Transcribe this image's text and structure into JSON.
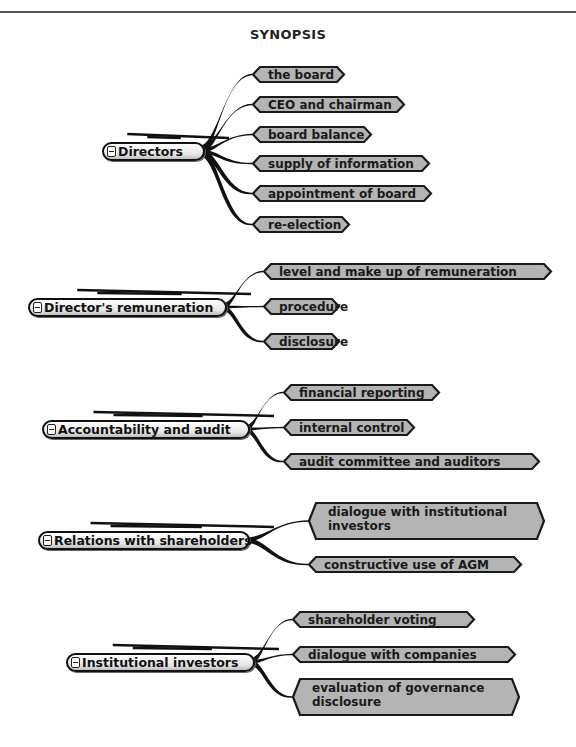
{
  "title": "SYNOPSIS",
  "colors": {
    "node_fill": "#b4b4b4",
    "node_border": "#1a1a1a",
    "connector": "#111111"
  },
  "groups": [
    {
      "label": "Directors",
      "root": {
        "x": 102,
        "y": 142,
        "w": 101
      },
      "children": [
        {
          "label": "the board",
          "x": 252,
          "y": 66,
          "w": 93,
          "h": 17
        },
        {
          "label": "CEO and chairman",
          "x": 252,
          "y": 96,
          "w": 153,
          "h": 17
        },
        {
          "label": "board balance",
          "x": 252,
          "y": 126,
          "w": 120,
          "h": 17
        },
        {
          "label": "supply of information",
          "x": 252,
          "y": 155,
          "w": 178,
          "h": 17
        },
        {
          "label": "appointment of board",
          "x": 252,
          "y": 185,
          "w": 180,
          "h": 17
        },
        {
          "label": "re-election",
          "x": 252,
          "y": 216,
          "w": 98,
          "h": 17
        }
      ]
    },
    {
      "label": "Director's remuneration",
      "root": {
        "x": 28,
        "y": 298,
        "w": 197
      },
      "children": [
        {
          "label": "level and make up of remuneration",
          "x": 263,
          "y": 263,
          "w": 289,
          "h": 17
        },
        {
          "label": "procedure",
          "x": 263,
          "y": 298,
          "w": 77,
          "h": 17
        },
        {
          "label": "disclosure",
          "x": 263,
          "y": 333,
          "w": 77,
          "h": 17
        }
      ]
    },
    {
      "label": "Accountability and audit",
      "root": {
        "x": 42,
        "y": 420,
        "w": 206
      },
      "children": [
        {
          "label": "financial reporting",
          "x": 283,
          "y": 384,
          "w": 157,
          "h": 17
        },
        {
          "label": "internal control",
          "x": 283,
          "y": 419,
          "w": 132,
          "h": 17
        },
        {
          "label": "audit committee and auditors",
          "x": 283,
          "y": 453,
          "w": 257,
          "h": 17
        }
      ]
    },
    {
      "label": "Relations with shareholders",
      "root": {
        "x": 38,
        "y": 531,
        "w": 210
      },
      "children": [
        {
          "label": "dialogue with institutional",
          "label2": "investors",
          "x": 308,
          "y": 502,
          "w": 237,
          "h": 38
        },
        {
          "label": "constructive use of AGM",
          "x": 308,
          "y": 556,
          "w": 214,
          "h": 17
        }
      ]
    },
    {
      "label": "Institutional investors",
      "root": {
        "x": 66,
        "y": 653,
        "w": 187
      },
      "children": [
        {
          "label": "shareholder voting",
          "x": 292,
          "y": 611,
          "w": 183,
          "h": 17
        },
        {
          "label": "dialogue with companies",
          "x": 292,
          "y": 646,
          "w": 224,
          "h": 17
        },
        {
          "label": "evaluation of governance",
          "label2": "disclosure",
          "x": 292,
          "y": 678,
          "w": 228,
          "h": 38
        }
      ]
    }
  ]
}
